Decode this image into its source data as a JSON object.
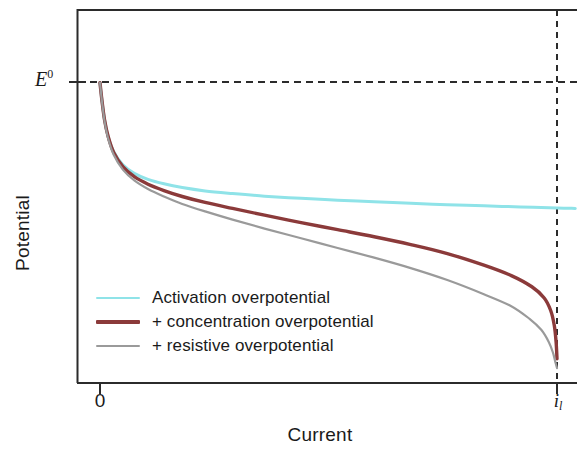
{
  "figure": {
    "axes": {
      "xlabel": "Current",
      "ylabel": "Potential",
      "x_ticks": [
        {
          "label": "0",
          "sub": ""
        },
        {
          "label": "i",
          "sub": "l"
        }
      ],
      "y_reference_label": "E",
      "y_reference_sup": "0"
    },
    "legend": [
      {
        "label": "Activation overpotential",
        "color": "#8fe3e8",
        "weight": "thin"
      },
      {
        "label": "+ concentration overpotential",
        "color": "#8b3a3a",
        "weight": "med"
      },
      {
        "label": "+ resistive overpotential",
        "color": "#9a9a9a",
        "weight": "thin"
      }
    ]
  },
  "chart_data": {
    "type": "line",
    "title": "",
    "xlabel": "Current",
    "ylabel": "Potential",
    "xlim": [
      0,
      1.04
    ],
    "ylim": [
      0,
      1
    ],
    "grid": false,
    "legend_position": "inside-lower-left",
    "annotations": [
      {
        "text": "E0",
        "type": "horizontal-reference-line",
        "y": 0.805,
        "style": "dashed"
      },
      {
        "text": "il",
        "type": "vertical-reference-line",
        "x": 1.0,
        "style": "dashed"
      }
    ],
    "x_tick_labels": [
      "0",
      "i_l"
    ],
    "x_tick_values": [
      0.0,
      1.0
    ],
    "series": [
      {
        "name": "Activation overpotential",
        "color": "#8fe3e8",
        "x": [
          0.0,
          0.004,
          0.01,
          0.018,
          0.03,
          0.05,
          0.075,
          0.105,
          0.14,
          0.18,
          0.23,
          0.29,
          0.36,
          0.44,
          0.52,
          0.6,
          0.68,
          0.76,
          0.84,
          0.92,
          1.0,
          1.04
        ],
        "y": [
          0.805,
          0.76,
          0.705,
          0.66,
          0.62,
          0.585,
          0.562,
          0.546,
          0.534,
          0.524,
          0.515,
          0.508,
          0.501,
          0.495,
          0.49,
          0.486,
          0.482,
          0.478,
          0.475,
          0.472,
          0.469,
          0.468
        ]
      },
      {
        "name": "+ concentration overpotential",
        "color": "#8b3a3a",
        "x": [
          0.0,
          0.004,
          0.01,
          0.018,
          0.03,
          0.05,
          0.075,
          0.105,
          0.14,
          0.18,
          0.23,
          0.29,
          0.36,
          0.44,
          0.52,
          0.6,
          0.68,
          0.76,
          0.84,
          0.9,
          0.945,
          0.972,
          0.986,
          0.994,
          0.998,
          1.0
        ],
        "y": [
          0.805,
          0.76,
          0.705,
          0.66,
          0.618,
          0.58,
          0.553,
          0.533,
          0.516,
          0.5,
          0.484,
          0.468,
          0.45,
          0.43,
          0.411,
          0.392,
          0.371,
          0.347,
          0.316,
          0.288,
          0.258,
          0.228,
          0.195,
          0.155,
          0.11,
          0.065
        ]
      },
      {
        "name": "+ resistive overpotential",
        "color": "#9a9a9a",
        "x": [
          0.0,
          0.004,
          0.01,
          0.018,
          0.03,
          0.05,
          0.075,
          0.105,
          0.14,
          0.18,
          0.23,
          0.29,
          0.36,
          0.44,
          0.52,
          0.6,
          0.68,
          0.76,
          0.84,
          0.9,
          0.94,
          0.966,
          0.982,
          0.991,
          0.996,
          1.0
        ],
        "y": [
          0.805,
          0.758,
          0.702,
          0.655,
          0.612,
          0.572,
          0.543,
          0.52,
          0.5,
          0.48,
          0.46,
          0.438,
          0.414,
          0.388,
          0.362,
          0.336,
          0.308,
          0.276,
          0.238,
          0.206,
          0.172,
          0.142,
          0.11,
          0.082,
          0.058,
          0.04
        ]
      }
    ]
  }
}
